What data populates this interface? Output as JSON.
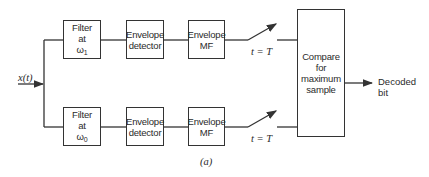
{
  "diagram": {
    "input": {
      "label": "x(t)"
    },
    "upper_branch": {
      "filter": {
        "line1": "Filter",
        "line2": "at",
        "omega": "ω",
        "sub": "1"
      },
      "detector": {
        "line1": "Envelope",
        "line2": "detector"
      },
      "matched_filter": {
        "line1": "Envelope",
        "line2": "MF"
      },
      "sampler": {
        "label": "t = T"
      }
    },
    "lower_branch": {
      "filter": {
        "line1": "Filter",
        "line2": "at",
        "omega": "ω",
        "sub": "0"
      },
      "detector": {
        "line1": "Envelope",
        "line2": "detector"
      },
      "matched_filter": {
        "line1": "Envelope",
        "line2": "MF"
      },
      "sampler": {
        "label": "t = T"
      }
    },
    "comparator": {
      "line1": "Compare",
      "line2": "for",
      "line3": "maximum",
      "line4": "sample"
    },
    "output": {
      "line1": "Decoded",
      "line2": "bit"
    },
    "caption": "(a)"
  }
}
